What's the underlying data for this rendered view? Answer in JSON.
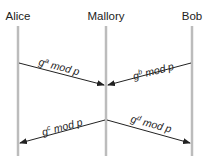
{
  "diagram": {
    "type": "sequence",
    "actors": [
      {
        "id": "alice",
        "label": "Alice"
      },
      {
        "id": "mallory",
        "label": "Mallory"
      },
      {
        "id": "bob",
        "label": "Bob"
      }
    ],
    "messages": [
      {
        "from": "alice",
        "to": "mallory",
        "base": "g",
        "exp": "a",
        "rest": " mod p"
      },
      {
        "from": "bob",
        "to": "mallory",
        "base": "g",
        "exp": "b",
        "rest": " mod p"
      },
      {
        "from": "mallory",
        "to": "alice",
        "base": "g",
        "exp": "c",
        "rest": " mod p"
      },
      {
        "from": "mallory",
        "to": "bob",
        "base": "g",
        "exp": "d",
        "rest": " mod p"
      }
    ],
    "colors": {
      "lifeline": "#bcbcbc",
      "arrow": "#222222",
      "text": "#222222"
    }
  }
}
